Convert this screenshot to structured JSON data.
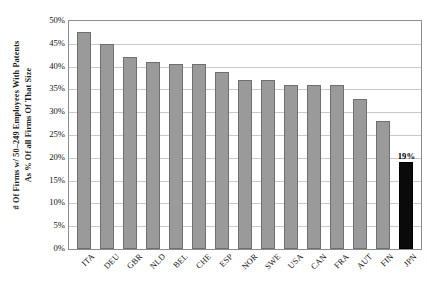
{
  "chart_data": {
    "type": "bar",
    "title": "",
    "subtitle": "",
    "xlabel": "",
    "ylabel_lines": [
      "# Of Firms w/ 50–249 Employees With Patents",
      "As % Of all Firms Of That Size"
    ],
    "categories": [
      "ITA",
      "DEU",
      "GBR",
      "NLD",
      "BEL",
      "CHE",
      "ESP",
      "NOR",
      "SWE",
      "USA",
      "CAN",
      "FRA",
      "AUT",
      "FIN",
      "JPN"
    ],
    "values": [
      47.5,
      45.0,
      42.0,
      41.0,
      40.5,
      40.5,
      38.8,
      37.0,
      37.0,
      36.0,
      36.0,
      36.0,
      33.0,
      28.0,
      19.0
    ],
    "bar_labels": [
      "",
      "",
      "",
      "",
      "",
      "",
      "",
      "",
      "",
      "",
      "",
      "",
      "",
      "",
      "19%"
    ],
    "highlight_index": 14,
    "ylim": [
      0,
      50
    ],
    "ytick_values": [
      0,
      5,
      10,
      15,
      20,
      25,
      30,
      35,
      40,
      45,
      50
    ],
    "ytick_labels": [
      "0%",
      "5%",
      "10%",
      "15%",
      "20%",
      "25%",
      "30%",
      "35%",
      "40%",
      "45%",
      "50%"
    ],
    "grid": true,
    "legend": "none",
    "colors": {
      "bar_fill": "#9a9a9a",
      "bar_edge": "#6f6f6f",
      "highlight_fill": "#0a0a0a",
      "highlight_edge": "#000000",
      "gridline": "#c9c9c9",
      "axis": "#8c8c8c",
      "text": "#111111",
      "background": "#ffffff"
    }
  }
}
